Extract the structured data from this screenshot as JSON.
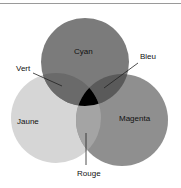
{
  "title": "",
  "colors": {
    "cyan_circle": "#7b7b7b",
    "jaune_circle": "#d6d6d6",
    "magenta_circle": "#8f8f8f",
    "overlap_vert": "#6a6a6a",
    "overlap_bleu": "#5a5a5a",
    "overlap_rouge": "#a4a4a4",
    "center": "#000000"
  },
  "labels": {
    "cyan": "Cyan",
    "bleu": "Bleu",
    "vert": "Vert",
    "jaune": "Jaune",
    "magenta": "Magenta",
    "rouge": "Rouge"
  }
}
